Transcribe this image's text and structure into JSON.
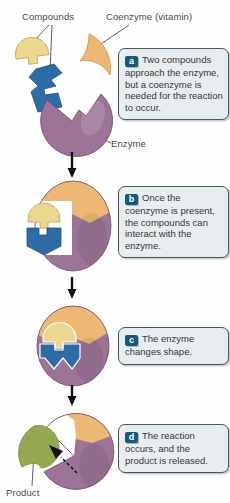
{
  "labels": {
    "compounds": "Compounds",
    "coenzyme": "Coenzyme (vitamin)",
    "enzyme": "Enzyme",
    "product": "Product"
  },
  "steps": [
    {
      "letter": "a",
      "text": "Two compounds approach the enzyme, but a coenzyme is needed for the reaction to occur."
    },
    {
      "letter": "b",
      "text": "Once the coenzyme is present, the compounds can interact with the enzyme."
    },
    {
      "letter": "c",
      "text": "The enzyme changes shape."
    },
    {
      "letter": "d",
      "text": "The reaction occurs, and the product is released."
    }
  ],
  "colors": {
    "enzyme_purple": "#9b7497",
    "enzyme_purple_dark": "#6a4766",
    "coenzyme_orange": "#edb873",
    "compound_yellow": "#ecd791",
    "compound_blue": "#2e6ca6",
    "product_green": "#93a850",
    "callout_bg": "#e8edf0",
    "callout_border": "#47565f",
    "badge_bg": "#0e5d79",
    "badge_text": "#ffffff",
    "label_text": "#4a4a4a",
    "arrow_black": "#111111",
    "white": "#ffffff"
  }
}
